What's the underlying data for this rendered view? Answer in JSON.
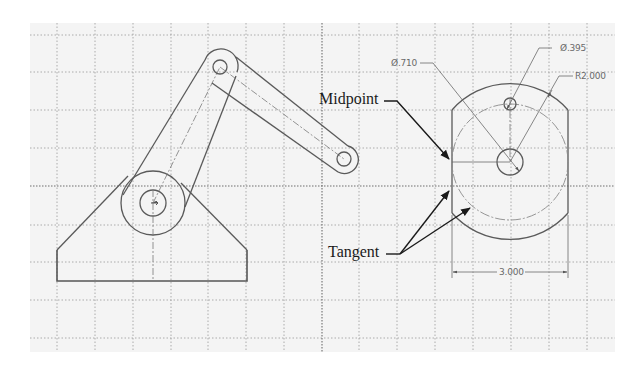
{
  "drawing": {
    "type": "cad-sketch",
    "background": "#f4f4f4",
    "grid": {
      "vertical_lines_x": [
        57,
        95,
        133,
        171,
        208,
        246,
        284,
        322,
        359,
        397,
        435,
        473,
        511,
        549,
        587
      ],
      "horizontal_lines_y": [
        35,
        72,
        110,
        148,
        186,
        225,
        262,
        300,
        338
      ],
      "major_x": 322,
      "major_y": 186
    }
  },
  "left_sketch": {
    "name": "linkage-arm",
    "pivot_center": [
      153,
      203
    ],
    "pivot_outer_radius": 32,
    "pivot_inner_radius": 13,
    "top_joint_center": [
      220,
      67
    ],
    "top_joint_outer_radius": 17,
    "top_joint_inner_radius": 7,
    "right_joint_center": [
      344,
      159
    ],
    "right_joint_outer_radius": 14,
    "right_joint_inner_radius": 7,
    "base": {
      "left_x": 57,
      "right_x": 247,
      "bottom_y": 281,
      "top_y": 250
    }
  },
  "right_sketch": {
    "name": "mounting-plate",
    "center": [
      510,
      162
    ],
    "center_hole_radius": 13,
    "top_hole_center": [
      510,
      104
    ],
    "top_hole_radius": 6,
    "outer_arc_radius": 77,
    "construction_circle_radius": 58,
    "left_edge_x": 452,
    "right_edge_x": 568
  },
  "dimensions": {
    "hole_diameter_large": "Ø.710",
    "hole_diameter_small": "Ø.395",
    "outer_radius": "R2.000",
    "width": "3.000"
  },
  "callouts": {
    "midpoint": "Midpoint",
    "tangent": "Tangent"
  }
}
